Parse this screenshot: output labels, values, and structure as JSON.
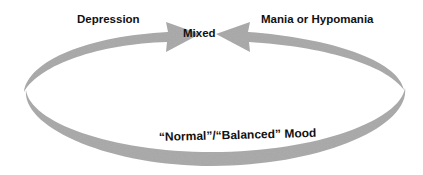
{
  "diagram": {
    "type": "cycle",
    "nodes": {
      "depression": "Depression",
      "mixed": "Mixed",
      "mania": "Mania or Hypomania",
      "normal": "“Normal”/“Balanced” Mood"
    },
    "edges": [
      {
        "from": "Depression",
        "to": "Mixed",
        "style": "curved-arrow"
      },
      {
        "from": "Mania or Hypomania",
        "to": "Mixed",
        "style": "curved-arrow"
      },
      {
        "from": "“Normal”/“Balanced” Mood",
        "to": "Depression",
        "style": "elliptical-band"
      },
      {
        "from": "“Normal”/“Balanced” Mood",
        "to": "Mania or Hypomania",
        "style": "elliptical-band"
      }
    ],
    "colors": {
      "band": "#a9a9a9",
      "band_dark": "#9a9a9a",
      "text": "#111111",
      "background": "#ffffff"
    }
  }
}
